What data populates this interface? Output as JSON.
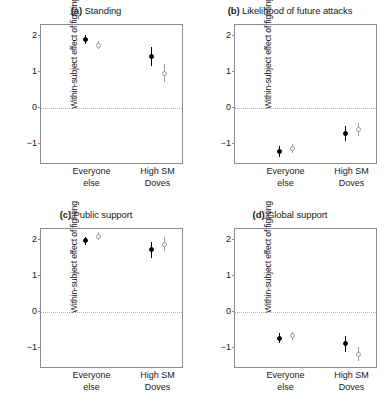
{
  "figure": {
    "ylabel": "Within-subject effect of fighting",
    "y_ticks": [
      "2",
      "1",
      "0",
      "−1"
    ],
    "x_categories": [
      {
        "line1": "Everyone",
        "line2": "else"
      },
      {
        "line1": "High SM",
        "line2": "Doves"
      }
    ],
    "colors": {
      "dark": "#000000",
      "light": "#9a9a9a",
      "frame": "#8c8c8c",
      "zero_line": "#b5b5b5"
    }
  },
  "chart_data": [
    {
      "type": "scatter",
      "panel": "a",
      "panel_label": "(a)",
      "title": "Standing",
      "xlabel": "",
      "ylabel": "Within-subject effect of fighting",
      "ylim": [
        -1.6,
        2.3
      ],
      "yticks": [
        2,
        1,
        0,
        -1
      ],
      "grid": false,
      "legend": "none",
      "zero_reference_line": 0,
      "categories": [
        "Everyone else",
        "High SM Doves"
      ],
      "series": [
        {
          "name": "dark",
          "values": [
            1.9,
            1.42
          ],
          "ci_low": [
            1.78,
            1.15
          ],
          "ci_high": [
            2.02,
            1.68
          ]
        },
        {
          "name": "light",
          "values": [
            1.74,
            0.95
          ],
          "ci_low": [
            1.62,
            0.72
          ],
          "ci_high": [
            1.86,
            1.2
          ]
        }
      ]
    },
    {
      "type": "scatter",
      "panel": "b",
      "panel_label": "(b)",
      "title": "Likelihood of future attacks",
      "xlabel": "",
      "ylabel": "Within-subject effect of fighting",
      "ylim": [
        -1.6,
        2.3
      ],
      "yticks": [
        2,
        1,
        0,
        -1
      ],
      "grid": false,
      "legend": "none",
      "zero_reference_line": 0,
      "categories": [
        "Everyone else",
        "High SM Doves"
      ],
      "series": [
        {
          "name": "dark",
          "values": [
            -1.22,
            -0.72
          ],
          "ci_low": [
            -1.38,
            -0.92
          ],
          "ci_high": [
            -1.08,
            -0.52
          ]
        },
        {
          "name": "light",
          "values": [
            -1.14,
            -0.62
          ],
          "ci_low": [
            -1.26,
            -0.8
          ],
          "ci_high": [
            -1.02,
            -0.44
          ]
        }
      ]
    },
    {
      "type": "scatter",
      "panel": "c",
      "panel_label": "(c)",
      "title": "Public support",
      "xlabel": "",
      "ylabel": "Within-subject effect of fighting",
      "ylim": [
        -1.6,
        2.3
      ],
      "yticks": [
        2,
        1,
        0,
        -1
      ],
      "grid": false,
      "legend": "none",
      "zero_reference_line": 0,
      "categories": [
        "Everyone else",
        "High SM Doves"
      ],
      "series": [
        {
          "name": "dark",
          "values": [
            1.97,
            1.73
          ],
          "ci_low": [
            1.86,
            1.5
          ],
          "ci_high": [
            2.08,
            1.95
          ]
        },
        {
          "name": "light",
          "values": [
            2.1,
            1.88
          ],
          "ci_low": [
            1.99,
            1.68
          ],
          "ci_high": [
            2.22,
            2.08
          ]
        }
      ]
    },
    {
      "type": "scatter",
      "panel": "d",
      "panel_label": "(d)",
      "title": "Global support",
      "xlabel": "",
      "ylabel": "Within-subject effect of fighting",
      "ylim": [
        -1.6,
        2.3
      ],
      "yticks": [
        2,
        1,
        0,
        -1
      ],
      "grid": false,
      "legend": "none",
      "zero_reference_line": 0,
      "categories": [
        "Everyone else",
        "High SM Doves"
      ],
      "series": [
        {
          "name": "dark",
          "values": [
            -0.75,
            -0.9
          ],
          "ci_low": [
            -0.88,
            -1.12
          ],
          "ci_high": [
            -0.6,
            -0.68
          ]
        },
        {
          "name": "light",
          "values": [
            -0.68,
            -1.2
          ],
          "ci_low": [
            -0.8,
            -1.38
          ],
          "ci_high": [
            -0.56,
            -1.0
          ]
        }
      ]
    }
  ]
}
